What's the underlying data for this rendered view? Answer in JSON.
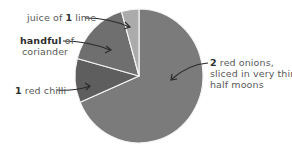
{
  "chart_data": {
    "type": "pie",
    "title": "",
    "start_angle_deg": 0,
    "direction": "clockwise",
    "slices": [
      {
        "name": "2 red onions, sliced in very thin half moons",
        "value": 68.6,
        "color": "#7b7b7b"
      },
      {
        "name": "1 red chilli",
        "value": 10.6,
        "color": "#5e5e5e"
      },
      {
        "name": "handful of coriander",
        "value": 16.4,
        "color": "#6f6f6f"
      },
      {
        "name": "juice of 1 lime",
        "value": 4.4,
        "color": "#ababab"
      }
    ]
  },
  "labels": {
    "lime": {
      "pre": "juice of ",
      "bold": "1",
      "post": " lime"
    },
    "coriander": {
      "bold": "handful",
      "post": " of",
      "line2": "coriander"
    },
    "chilli": {
      "bold": "1",
      "post": " red chilli"
    },
    "onion": {
      "bold": "2",
      "post": " red onions,",
      "line2": "sliced in very thin",
      "line3": "half moons"
    }
  }
}
